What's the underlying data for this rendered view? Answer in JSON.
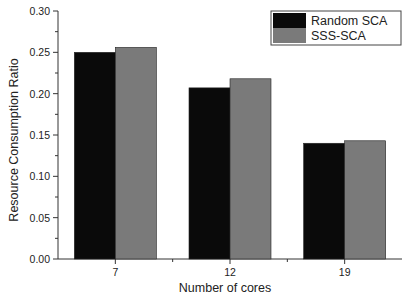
{
  "chart_data": {
    "type": "bar",
    "title": "",
    "xlabel": "Number of cores",
    "ylabel": "Resource Consumption Ratio",
    "categories": [
      "7",
      "12",
      "19"
    ],
    "series": [
      {
        "name": "Random SCA",
        "color": "#0a0a0a",
        "values": [
          0.25,
          0.207,
          0.14
        ]
      },
      {
        "name": "SSS-SCA",
        "color": "#7a7a7a",
        "values": [
          0.256,
          0.218,
          0.143
        ]
      }
    ],
    "ylim": [
      0.0,
      0.3
    ],
    "yticks": [
      "0.00",
      "0.05",
      "0.10",
      "0.15",
      "0.20",
      "0.25",
      "0.30"
    ],
    "grid": false,
    "legend_position": "top-right"
  }
}
